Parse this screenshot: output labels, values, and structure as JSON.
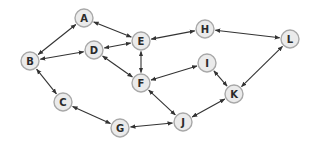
{
  "diagram": {
    "type": "graph",
    "directed": true,
    "node_radius": 9,
    "colors": {
      "node_fill": "#ebebeb",
      "node_stroke": "#a8a8a8",
      "edge": "#333333",
      "label": "#2a2a2a",
      "background": "#ffffff"
    },
    "nodes": [
      {
        "id": "A",
        "label": "A",
        "x": 84,
        "y": 18
      },
      {
        "id": "B",
        "label": "B",
        "x": 30,
        "y": 61
      },
      {
        "id": "C",
        "label": "C",
        "x": 63,
        "y": 102
      },
      {
        "id": "D",
        "label": "D",
        "x": 94,
        "y": 50
      },
      {
        "id": "E",
        "label": "E",
        "x": 141,
        "y": 41
      },
      {
        "id": "F",
        "label": "F",
        "x": 141,
        "y": 83
      },
      {
        "id": "G",
        "label": "G",
        "x": 120,
        "y": 128
      },
      {
        "id": "H",
        "label": "H",
        "x": 205,
        "y": 29
      },
      {
        "id": "I",
        "label": "I",
        "x": 207,
        "y": 63
      },
      {
        "id": "J",
        "label": "J",
        "x": 183,
        "y": 122
      },
      {
        "id": "K",
        "label": "K",
        "x": 234,
        "y": 94
      },
      {
        "id": "L",
        "label": "L",
        "x": 290,
        "y": 39
      }
    ],
    "edges": [
      {
        "from": "A",
        "to": "B",
        "bidirectional": true
      },
      {
        "from": "A",
        "to": "E",
        "bidirectional": true
      },
      {
        "from": "B",
        "to": "D",
        "bidirectional": true
      },
      {
        "from": "B",
        "to": "C",
        "bidirectional": true
      },
      {
        "from": "D",
        "to": "E",
        "bidirectional": true
      },
      {
        "from": "D",
        "to": "F",
        "bidirectional": true
      },
      {
        "from": "E",
        "to": "F",
        "bidirectional": true
      },
      {
        "from": "E",
        "to": "H",
        "bidirectional": true
      },
      {
        "from": "H",
        "to": "L",
        "bidirectional": true
      },
      {
        "from": "F",
        "to": "I",
        "bidirectional": true
      },
      {
        "from": "F",
        "to": "J",
        "bidirectional": true
      },
      {
        "from": "I",
        "to": "K",
        "bidirectional": true
      },
      {
        "from": "L",
        "to": "K",
        "bidirectional": true
      },
      {
        "from": "C",
        "to": "G",
        "bidirectional": true
      },
      {
        "from": "G",
        "to": "J",
        "bidirectional": true
      },
      {
        "from": "J",
        "to": "K",
        "bidirectional": true
      }
    ]
  }
}
